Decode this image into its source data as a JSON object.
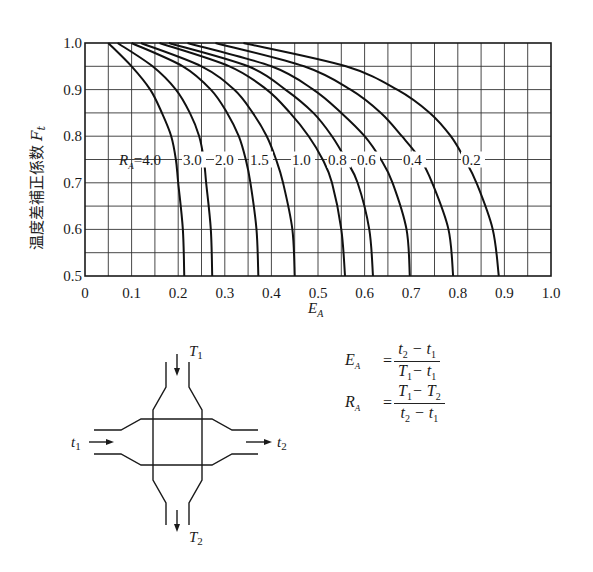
{
  "chart_data": {
    "type": "line",
    "title": "",
    "xlabel": "E_A",
    "ylabel": "温度差補正係数 Ft",
    "xlim": [
      0,
      1.0
    ],
    "ylim": [
      0.5,
      1.0
    ],
    "grid": true,
    "grid_step": {
      "x": 0.05,
      "y": 0.05
    },
    "x_ticks": [
      "0",
      "0.1",
      "0.2",
      "0.3",
      "0.4",
      "0.5",
      "0.6",
      "0.7",
      "0.8",
      "0.9",
      "1.0"
    ],
    "y_ticks": [
      "0.5",
      "0.6",
      "0.7",
      "0.8",
      "0.9",
      "1.0"
    ],
    "legend_prefix": "R_A =",
    "series": [
      {
        "name": "4.0",
        "points": [
          [
            0.05,
            1.0
          ],
          [
            0.1,
            0.95
          ],
          [
            0.14,
            0.9
          ],
          [
            0.165,
            0.85
          ],
          [
            0.185,
            0.8
          ],
          [
            0.195,
            0.75
          ],
          [
            0.2,
            0.7
          ],
          [
            0.21,
            0.6
          ],
          [
            0.213,
            0.5
          ]
        ]
      },
      {
        "name": "3.0",
        "points": [
          [
            0.07,
            1.0
          ],
          [
            0.145,
            0.95
          ],
          [
            0.195,
            0.9
          ],
          [
            0.225,
            0.85
          ],
          [
            0.245,
            0.8
          ],
          [
            0.255,
            0.75
          ],
          [
            0.26,
            0.7
          ],
          [
            0.27,
            0.6
          ],
          [
            0.273,
            0.5
          ]
        ]
      },
      {
        "name": "2.0",
        "points": [
          [
            0.1,
            1.0
          ],
          [
            0.21,
            0.95
          ],
          [
            0.27,
            0.9
          ],
          [
            0.305,
            0.85
          ],
          [
            0.33,
            0.8
          ],
          [
            0.345,
            0.75
          ],
          [
            0.355,
            0.7
          ],
          [
            0.368,
            0.6
          ],
          [
            0.372,
            0.5
          ]
        ]
      },
      {
        "name": "1.5",
        "points": [
          [
            0.12,
            1.0
          ],
          [
            0.25,
            0.95
          ],
          [
            0.32,
            0.9
          ],
          [
            0.36,
            0.85
          ],
          [
            0.39,
            0.8
          ],
          [
            0.41,
            0.75
          ],
          [
            0.425,
            0.7
          ],
          [
            0.445,
            0.6
          ],
          [
            0.45,
            0.5
          ]
        ]
      },
      {
        "name": "1.0",
        "points": [
          [
            0.16,
            1.0
          ],
          [
            0.31,
            0.95
          ],
          [
            0.39,
            0.9
          ],
          [
            0.44,
            0.85
          ],
          [
            0.48,
            0.8
          ],
          [
            0.51,
            0.75
          ],
          [
            0.53,
            0.7
          ],
          [
            0.55,
            0.6
          ],
          [
            0.558,
            0.5
          ]
        ]
      },
      {
        "name": "0.8",
        "points": [
          [
            0.18,
            1.0
          ],
          [
            0.35,
            0.95
          ],
          [
            0.43,
            0.9
          ],
          [
            0.49,
            0.85
          ],
          [
            0.53,
            0.8
          ],
          [
            0.56,
            0.75
          ],
          [
            0.585,
            0.7
          ],
          [
            0.61,
            0.6
          ],
          [
            0.618,
            0.5
          ]
        ]
      },
      {
        "name": "0.6",
        "points": [
          [
            0.22,
            1.0
          ],
          [
            0.4,
            0.95
          ],
          [
            0.49,
            0.9
          ],
          [
            0.55,
            0.85
          ],
          [
            0.6,
            0.8
          ],
          [
            0.635,
            0.75
          ],
          [
            0.66,
            0.7
          ],
          [
            0.69,
            0.6
          ],
          [
            0.697,
            0.5
          ]
        ]
      },
      {
        "name": "0.4",
        "points": [
          [
            0.28,
            1.0
          ],
          [
            0.47,
            0.95
          ],
          [
            0.57,
            0.9
          ],
          [
            0.635,
            0.85
          ],
          [
            0.68,
            0.8
          ],
          [
            0.72,
            0.75
          ],
          [
            0.745,
            0.7
          ],
          [
            0.78,
            0.6
          ],
          [
            0.79,
            0.5
          ]
        ]
      },
      {
        "name": "0.2",
        "points": [
          [
            0.34,
            1.0
          ],
          [
            0.56,
            0.95
          ],
          [
            0.67,
            0.9
          ],
          [
            0.74,
            0.85
          ],
          [
            0.785,
            0.8
          ],
          [
            0.815,
            0.75
          ],
          [
            0.84,
            0.7
          ],
          [
            0.875,
            0.6
          ],
          [
            0.888,
            0.5
          ]
        ]
      }
    ],
    "annotations": [
      "R_A = 4.0",
      "3.0",
      "2.0",
      "1.5",
      "1.0",
      "0.8",
      "0.6",
      "0.4",
      "0.2"
    ]
  },
  "labels": {
    "ylabel_text": "温度差補正係数",
    "ylabel_symbol": "F",
    "ylabel_sub": "t",
    "xlabel_symbol": "E",
    "xlabel_sub": "A",
    "legend_R": "R",
    "legend_sub": "A",
    "legend_eq": "=4.0"
  },
  "diagram": {
    "T1": "T",
    "T1_sub": "1",
    "T2": "T",
    "T2_sub": "2",
    "t1": "t",
    "t1_sub": "1",
    "t2": "t",
    "t2_sub": "2"
  },
  "formulas": {
    "EA_lhs": "E",
    "EA_sub": "A",
    "EA_num_a": "t",
    "EA_num_a_sub": "2",
    "EA_num_op": " − ",
    "EA_num_b": "t",
    "EA_num_b_sub": "1",
    "EA_den_a": "T",
    "EA_den_a_sub": "1",
    "EA_den_op": "− ",
    "EA_den_b": "t",
    "EA_den_b_sub": "1",
    "RA_lhs": "R",
    "RA_sub": "A",
    "RA_num_a": "T",
    "RA_num_a_sub": "1",
    "RA_num_op": "− ",
    "RA_num_b": "T",
    "RA_num_b_sub": "2",
    "RA_den_a": "t",
    "RA_den_a_sub": "2",
    "RA_den_op": " − ",
    "RA_den_b": "t",
    "RA_den_b_sub": "1",
    "equals": "="
  }
}
